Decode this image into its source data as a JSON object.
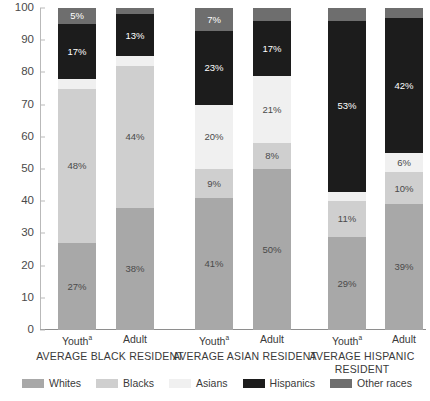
{
  "chart_data": {
    "type": "bar",
    "subtype": "stacked-bar-100",
    "title": "",
    "xlabel": "",
    "ylabel": "",
    "ylim": [
      0,
      100
    ],
    "yticks": [
      0,
      10,
      20,
      30,
      40,
      50,
      60,
      70,
      80,
      90,
      100
    ],
    "grid": false,
    "legend_position": "bottom",
    "legend": [
      "Whites",
      "Blacks",
      "Asians",
      "Hispanics",
      "Other races"
    ],
    "series_colors": {
      "Whites": "#a8a8a8",
      "Blacks": "#cfcfcf",
      "Asians": "#f0f0f0",
      "Hispanics": "#1c1c1c",
      "Other races": "#6e6e6e"
    },
    "groups": [
      {
        "name": "AVERAGE BLACK RESIDENT",
        "bars": [
          {
            "name": "Youth",
            "footnote": "a"
          },
          {
            "name": "Adult",
            "footnote": ""
          }
        ]
      },
      {
        "name": "AVERAGE ASIAN RESIDENT",
        "bars": [
          {
            "name": "Youth",
            "footnote": "a"
          },
          {
            "name": "Adult",
            "footnote": ""
          }
        ]
      },
      {
        "name": "AVERAGE HISPANIC RESIDENT",
        "bars": [
          {
            "name": "Youth",
            "footnote": "a"
          },
          {
            "name": "Adult",
            "footnote": ""
          }
        ]
      }
    ],
    "categories": [
      "Black Youth",
      "Black Adult",
      "Asian Youth",
      "Asian Adult",
      "Hispanic Youth",
      "Hispanic Adult"
    ],
    "series": [
      {
        "name": "Whites",
        "values": [
          27,
          38,
          41,
          50,
          29,
          39
        ],
        "labels": [
          "27%",
          "38%",
          "41%",
          "50%",
          "29%",
          "39%"
        ]
      },
      {
        "name": "Blacks",
        "values": [
          48,
          44,
          9,
          8,
          11,
          10
        ],
        "labels": [
          "48%",
          "44%",
          "9%",
          "8%",
          "11%",
          "10%"
        ]
      },
      {
        "name": "Asians",
        "values": [
          3,
          3,
          20,
          21,
          3,
          6
        ],
        "labels": [
          "",
          "",
          "20%",
          "21%",
          "",
          "6%"
        ]
      },
      {
        "name": "Hispanics",
        "values": [
          17,
          13,
          23,
          17,
          53,
          42
        ],
        "labels": [
          "17%",
          "13%",
          "23%",
          "17%",
          "53%",
          "42%"
        ]
      },
      {
        "name": "Other races",
        "values": [
          5,
          2,
          7,
          4,
          4,
          3
        ],
        "labels": [
          "5%",
          "",
          "7%",
          "",
          "",
          ""
        ]
      }
    ]
  },
  "axis": {
    "tick_labels": [
      "0",
      "10",
      "20",
      "30",
      "40",
      "50",
      "60",
      "70",
      "80",
      "90",
      "100"
    ]
  },
  "legend": {
    "items": [
      {
        "label": "Whites",
        "color": "#a8a8a8"
      },
      {
        "label": "Blacks",
        "color": "#cfcfcf"
      },
      {
        "label": "Asians",
        "color": "#f0f0f0"
      },
      {
        "label": "Hispanics",
        "color": "#1c1c1c"
      },
      {
        "label": "Other races",
        "color": "#6e6e6e"
      }
    ]
  }
}
